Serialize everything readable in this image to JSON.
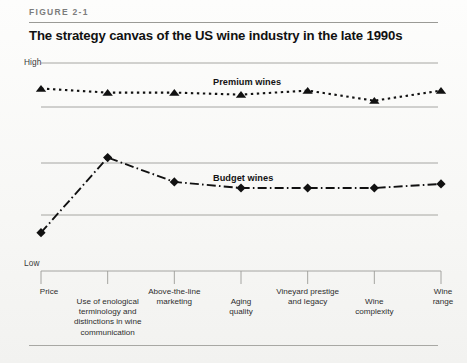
{
  "figure": {
    "label": "FIGURE 2-1",
    "title": "The strategy canvas of the US wine industry in the late 1990s"
  },
  "axis": {
    "high_label": "High",
    "low_label": "Low"
  },
  "series_labels": {
    "premium": "Premium wines",
    "budget": "Budget wines"
  },
  "colors": {
    "line": "#111111",
    "gridline": "#9c9c98",
    "rule": "#9a9a96",
    "text": "#1a1a1a",
    "figure_label": "#7c7c7c",
    "background": "#fbfbfa"
  },
  "chart_data": {
    "type": "line",
    "title": "The strategy canvas of the US wine industry in the late 1990s",
    "xlabel": "",
    "ylabel": "",
    "ylim": [
      0,
      100
    ],
    "ytick_labels": [
      "Low",
      "High"
    ],
    "grid": true,
    "legend": "inline-annotations",
    "categories": [
      "Price",
      "Use of enological terminology and distinctions in wine communication",
      "Above-the-line marketing",
      "Aging quality",
      "Vineyard prestige and legacy",
      "Wine complexity",
      "Wine range"
    ],
    "category_lines": [
      [
        "Price"
      ],
      [
        "Use of enological",
        "terminology and",
        "distinctions in wine",
        "communication"
      ],
      [
        "Above-the-line",
        "marketing"
      ],
      [
        "Aging",
        "quality"
      ],
      [
        "Vineyard prestige",
        "and legacy"
      ],
      [
        "Wine",
        "complexity"
      ],
      [
        "Wine",
        "range"
      ]
    ],
    "series": [
      {
        "name": "Premium wines",
        "marker": "triangle",
        "linestyle": "dotted",
        "values": [
          82,
          80,
          80,
          79,
          81,
          76,
          81
        ]
      },
      {
        "name": "Budget wines",
        "marker": "diamond",
        "linestyle": "dashdot",
        "values": [
          11,
          48,
          36,
          33,
          33,
          33,
          35
        ]
      }
    ]
  }
}
